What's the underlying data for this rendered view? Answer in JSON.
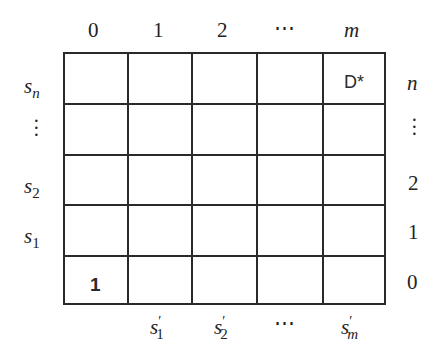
{
  "column_headers": [
    "0",
    "1",
    "2",
    "⋯",
    "m"
  ],
  "row_labels_left": [
    {
      "base": "s",
      "sub": "n"
    },
    {
      "base": "⋮",
      "sub": ""
    },
    {
      "base": "s",
      "sub": "2"
    },
    {
      "base": "s",
      "sub": "1"
    }
  ],
  "row_labels_right": [
    "n",
    "⋮",
    "2",
    "1",
    "0"
  ],
  "bottom_labels": [
    {
      "base": "s",
      "sup": "′",
      "sub": "1"
    },
    {
      "base": "s",
      "sup": "′",
      "sub": "2"
    },
    {
      "base": "⋯"
    },
    {
      "base": "s",
      "sup": "′",
      "sub": "m"
    }
  ],
  "cells": {
    "top_right": "D*",
    "bottom_left": "1"
  },
  "grid": {
    "rows": 5,
    "cols": 5
  }
}
